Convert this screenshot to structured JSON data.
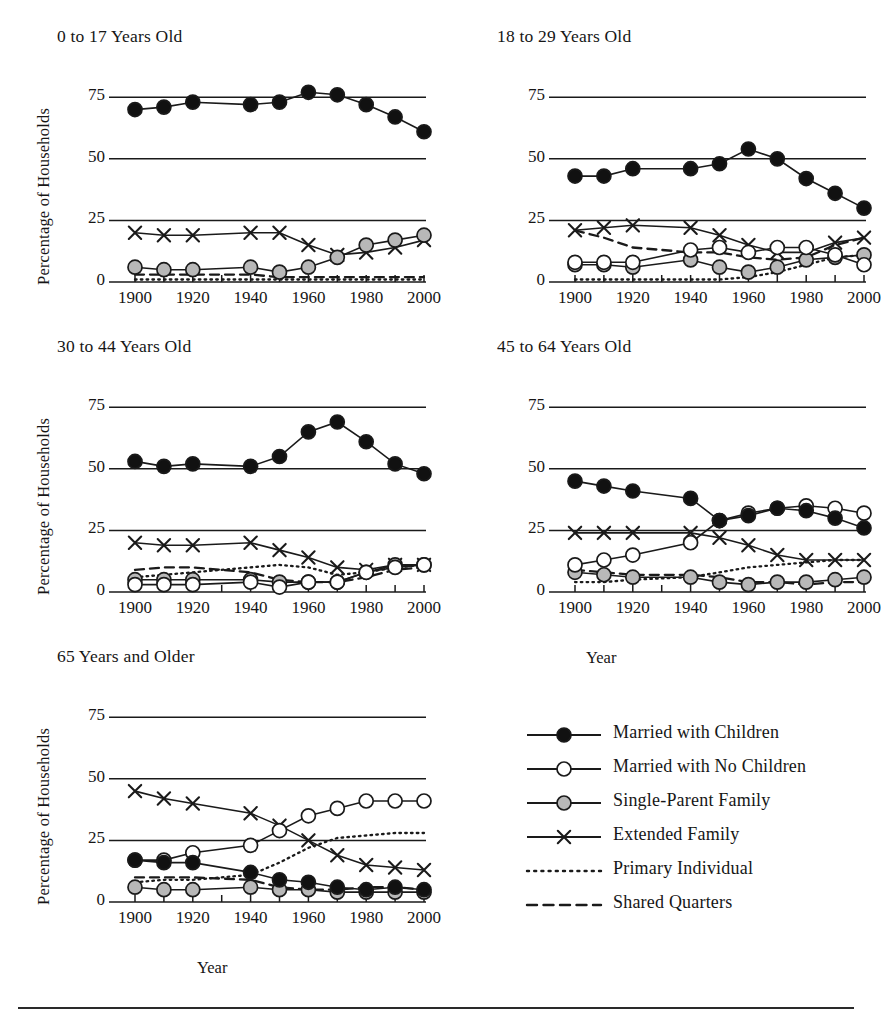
{
  "figure": {
    "axis_y_label": "Percentage of Households",
    "axis_x_label": "Year",
    "y_ticks": [
      "0",
      "25",
      "50",
      "75"
    ],
    "y_tick_values": [
      0,
      25,
      50,
      75
    ],
    "x_ticks": [
      "1900",
      "1920",
      "1940",
      "1960",
      "1980",
      "2000"
    ],
    "x_tick_values": [
      1900,
      1920,
      1940,
      1960,
      1980,
      2000
    ],
    "colors": {
      "line": "#1a1a1a",
      "marker_filled": "#111111",
      "marker_open": "#ffffff",
      "marker_gray": "#b8b8b8",
      "text": "#161616",
      "rule": "#2a2a2a"
    }
  },
  "legend": {
    "position": "bottom-right",
    "items": [
      {
        "label": "Married with Children",
        "marker": "filled-circle",
        "line": "solid"
      },
      {
        "label": "Married with No Children",
        "marker": "open-circle",
        "line": "solid"
      },
      {
        "label": "Single-Parent Family",
        "marker": "gray-circle",
        "line": "solid"
      },
      {
        "label": "Extended Family",
        "marker": "cross",
        "line": "solid"
      },
      {
        "label": "Primary Individual",
        "marker": "none",
        "line": "dotted"
      },
      {
        "label": "Shared Quarters",
        "marker": "none",
        "line": "dashed"
      }
    ]
  },
  "chart_data": {
    "type": "line",
    "title": "",
    "xlabel": "Year",
    "ylabel": "Percentage of Households",
    "xlim": [
      1900,
      2000
    ],
    "ylim": [
      0,
      82
    ],
    "grid": "horizontal gridlines at 0, 25, 50, 75",
    "x": [
      1900,
      1910,
      1920,
      1930,
      1940,
      1950,
      1960,
      1970,
      1980,
      1990,
      2000
    ],
    "x_note": "Decennial census years; 1930 not plotted as a marker in any panel",
    "panels": [
      {
        "title": "0 to 17 Years Old",
        "x": [
          1900,
          1910,
          1920,
          1940,
          1950,
          1960,
          1970,
          1980,
          1990,
          2000
        ],
        "series": [
          {
            "name": "Married with Children",
            "values": [
              70,
              71,
              73,
              72,
              73,
              77,
              76,
              72,
              67,
              61
            ]
          },
          {
            "name": "Married with No Children",
            "values": [
              0,
              0,
              0,
              0,
              0,
              0,
              0,
              0,
              0,
              0
            ]
          },
          {
            "name": "Single-Parent Family",
            "values": [
              6,
              5,
              5,
              6,
              4,
              6,
              10,
              15,
              17,
              19
            ]
          },
          {
            "name": "Extended Family",
            "values": [
              20,
              19,
              19,
              20,
              20,
              15,
              11,
              12,
              14,
              17
            ]
          },
          {
            "name": "Primary Individual",
            "values": [
              1,
              1,
              1,
              1,
              1,
              1,
              1,
              1,
              1,
              1
            ]
          },
          {
            "name": "Shared Quarters",
            "values": [
              3,
              3,
              3,
              3,
              2,
              2,
              2,
              2,
              2,
              2
            ]
          }
        ]
      },
      {
        "title": "18 to 29 Years Old",
        "x": [
          1900,
          1910,
          1920,
          1940,
          1950,
          1960,
          1970,
          1980,
          1990,
          2000
        ],
        "series": [
          {
            "name": "Married with Children",
            "values": [
              43,
              43,
              46,
              46,
              48,
              54,
              50,
              42,
              36,
              30
            ]
          },
          {
            "name": "Married with No Children",
            "values": [
              8,
              8,
              8,
              13,
              14,
              12,
              14,
              14,
              11,
              7
            ]
          },
          {
            "name": "Single-Parent Family",
            "values": [
              7,
              7,
              6,
              9,
              6,
              4,
              6,
              9,
              10,
              11
            ]
          },
          {
            "name": "Extended Family",
            "values": [
              21,
              22,
              23,
              22,
              19,
              15,
              12,
              12,
              16,
              18
            ]
          },
          {
            "name": "Primary Individual",
            "values": [
              1,
              1,
              1,
              1,
              1,
              2,
              4,
              7,
              10,
              11
            ]
          },
          {
            "name": "Shared Quarters",
            "values": [
              21,
              18,
              14,
              12,
              12,
              10,
              9,
              10,
              15,
              18
            ]
          }
        ]
      },
      {
        "title": "30 to 44 Years Old",
        "x": [
          1900,
          1910,
          1920,
          1940,
          1950,
          1960,
          1970,
          1980,
          1990,
          2000
        ],
        "series": [
          {
            "name": "Married with Children",
            "values": [
              53,
              51,
              52,
              51,
              55,
              65,
              69,
              61,
              52,
              48
            ]
          },
          {
            "name": "Married with No Children",
            "values": [
              3,
              3,
              3,
              4,
              2,
              4,
              4,
              8,
              10,
              11
            ]
          },
          {
            "name": "Single-Parent Family",
            "values": [
              5,
              5,
              5,
              5,
              4,
              4,
              4,
              8,
              11,
              11
            ]
          },
          {
            "name": "Extended Family",
            "values": [
              20,
              19,
              19,
              20,
              17,
              14,
              10,
              9,
              11,
              11
            ]
          },
          {
            "name": "Primary Individual",
            "values": [
              6,
              7,
              8,
              10,
              11,
              10,
              7,
              8,
              10,
              11
            ]
          },
          {
            "name": "Shared Quarters",
            "values": [
              9,
              10,
              10,
              8,
              5,
              4,
              4,
              6,
              9,
              10
            ]
          }
        ]
      },
      {
        "title": "45 to 64 Years Old",
        "x": [
          1900,
          1910,
          1920,
          1940,
          1950,
          1960,
          1970,
          1980,
          1990,
          2000
        ],
        "series": [
          {
            "name": "Married with Children",
            "values": [
              45,
              43,
              41,
              38,
              29,
              31,
              34,
              33,
              30,
              26
            ]
          },
          {
            "name": "Married with No Children",
            "values": [
              11,
              13,
              15,
              20,
              29,
              32,
              34,
              35,
              34,
              32
            ]
          },
          {
            "name": "Single-Parent Family",
            "values": [
              8,
              7,
              6,
              6,
              4,
              3,
              4,
              4,
              5,
              6
            ]
          },
          {
            "name": "Extended Family",
            "values": [
              24,
              24,
              24,
              24,
              22,
              19,
              15,
              13,
              13,
              13
            ]
          },
          {
            "name": "Primary Individual",
            "values": [
              4,
              4,
              5,
              6,
              8,
              10,
              11,
              12,
              13,
              13
            ]
          },
          {
            "name": "Shared Quarters",
            "values": [
              9,
              8,
              7,
              7,
              6,
              4,
              4,
              3,
              4,
              4
            ]
          }
        ]
      },
      {
        "title": "65 Years and Older",
        "x": [
          1900,
          1910,
          1920,
          1940,
          1950,
          1960,
          1970,
          1980,
          1990,
          2000
        ],
        "series": [
          {
            "name": "Married with Children",
            "values": [
              17,
              16,
              16,
              12,
              9,
              8,
              6,
              5,
              6,
              5
            ]
          },
          {
            "name": "Married with No Children",
            "values": [
              17,
              17,
              20,
              23,
              29,
              35,
              38,
              41,
              41,
              41
            ]
          },
          {
            "name": "Single-Parent Family",
            "values": [
              6,
              5,
              5,
              6,
              5,
              5,
              4,
              4,
              4,
              4
            ]
          },
          {
            "name": "Extended Family",
            "values": [
              45,
              42,
              40,
              36,
              31,
              25,
              19,
              15,
              14,
              13
            ]
          },
          {
            "name": "Primary Individual",
            "values": [
              8,
              9,
              9,
              11,
              16,
              22,
              26,
              27,
              28,
              28
            ]
          },
          {
            "name": "Shared Quarters",
            "values": [
              10,
              10,
              10,
              9,
              6,
              5,
              5,
              6,
              6,
              5
            ]
          }
        ]
      }
    ]
  }
}
